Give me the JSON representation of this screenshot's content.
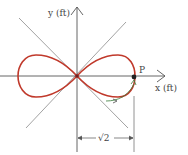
{
  "diagram": {
    "axes": {
      "x_label": "x (ft)",
      "y_label": "y (ft)"
    },
    "point": {
      "label": "P"
    },
    "dimension": {
      "label": "√2"
    },
    "colors": {
      "curve": "#c0392b",
      "axes": "#555555",
      "lines": "#888888",
      "motion_arrow": "#3a7d3a",
      "point": "#222222"
    }
  }
}
